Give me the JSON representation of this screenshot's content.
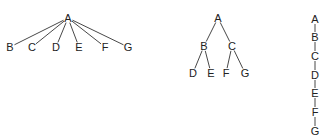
{
  "diagrams": [
    {
      "name": "flat-tree",
      "nodes": [
        {
          "id": "A",
          "label": "A",
          "x": 68,
          "y": 18
        },
        {
          "id": "B",
          "label": "B",
          "x": 10,
          "y": 47
        },
        {
          "id": "C",
          "label": "C",
          "x": 32,
          "y": 47
        },
        {
          "id": "D",
          "label": "D",
          "x": 56,
          "y": 47
        },
        {
          "id": "E",
          "label": "E",
          "x": 79,
          "y": 47
        },
        {
          "id": "F",
          "label": "F",
          "x": 105,
          "y": 47
        },
        {
          "id": "G",
          "label": "G",
          "x": 128,
          "y": 47
        }
      ],
      "edges": [
        [
          "A",
          "B"
        ],
        [
          "A",
          "C"
        ],
        [
          "A",
          "D"
        ],
        [
          "A",
          "E"
        ],
        [
          "A",
          "F"
        ],
        [
          "A",
          "G"
        ]
      ]
    },
    {
      "name": "binary-tree",
      "nodes": [
        {
          "id": "A",
          "label": "A",
          "x": 218,
          "y": 18
        },
        {
          "id": "B",
          "label": "B",
          "x": 204,
          "y": 46
        },
        {
          "id": "C",
          "label": "C",
          "x": 232,
          "y": 46
        },
        {
          "id": "D",
          "label": "D",
          "x": 193,
          "y": 73
        },
        {
          "id": "E",
          "label": "E",
          "x": 211,
          "y": 73
        },
        {
          "id": "F",
          "label": "F",
          "x": 226,
          "y": 73
        },
        {
          "id": "G",
          "label": "G",
          "x": 245,
          "y": 73
        }
      ],
      "edges": [
        [
          "A",
          "B"
        ],
        [
          "A",
          "C"
        ],
        [
          "B",
          "D"
        ],
        [
          "B",
          "E"
        ],
        [
          "C",
          "F"
        ],
        [
          "C",
          "G"
        ]
      ]
    },
    {
      "name": "chain",
      "nodes": [
        {
          "id": "A",
          "label": "A",
          "x": 315,
          "y": 19
        },
        {
          "id": "B",
          "label": "B",
          "x": 315,
          "y": 37
        },
        {
          "id": "C",
          "label": "C",
          "x": 315,
          "y": 56
        },
        {
          "id": "D",
          "label": "D",
          "x": 315,
          "y": 75
        },
        {
          "id": "E",
          "label": "E",
          "x": 315,
          "y": 93
        },
        {
          "id": "F",
          "label": "F",
          "x": 315,
          "y": 112
        },
        {
          "id": "G",
          "label": "G",
          "x": 315,
          "y": 131
        }
      ],
      "edges": [
        [
          "A",
          "B"
        ],
        [
          "B",
          "C"
        ],
        [
          "C",
          "D"
        ],
        [
          "D",
          "E"
        ],
        [
          "E",
          "F"
        ],
        [
          "F",
          "G"
        ]
      ]
    }
  ]
}
